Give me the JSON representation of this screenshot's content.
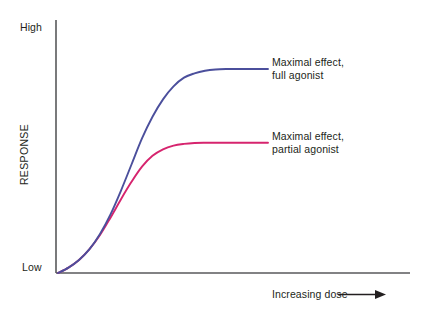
{
  "figure": {
    "background_color": "#ffffff",
    "axis_color": "#58595b"
  },
  "chart_data": {
    "type": "line",
    "title": "",
    "xlabel": "Increasing dose",
    "ylabel": "RESPONSE",
    "xlim": [
      0,
      10
    ],
    "ylim": [
      0,
      10
    ],
    "grid": false,
    "legend_position": "inline-right-of-curve",
    "x_tick_labels": [],
    "y_tick_labels": [
      "Low",
      "High"
    ],
    "annotations": [
      "Maximal effect, full agonist",
      "Maximal effect, partial agonist"
    ],
    "series": [
      {
        "name": "Maximal effect, full agonist",
        "color": "#4b4f9c",
        "maximal_effect": 9.4,
        "x": [
          0.0,
          0.5,
          1.0,
          1.5,
          2.0,
          2.5,
          3.0,
          3.5,
          4.0,
          4.5,
          5.0,
          5.5,
          6.0,
          6.5,
          7.0,
          7.5,
          8.0,
          8.5,
          9.0,
          9.5,
          10.0
        ],
        "y": [
          0.0,
          0.25,
          0.6,
          1.1,
          1.8,
          2.7,
          3.8,
          5.0,
          6.2,
          7.2,
          8.0,
          8.6,
          9.0,
          9.2,
          9.32,
          9.38,
          9.4,
          9.4,
          9.4,
          9.4,
          9.4
        ]
      },
      {
        "name": "Maximal effect, partial agonist",
        "color": "#d6246e",
        "maximal_effect": 6.0,
        "x": [
          0.0,
          0.5,
          1.0,
          1.5,
          2.0,
          2.5,
          3.0,
          3.5,
          4.0,
          4.5,
          5.0,
          5.5,
          6.0,
          6.5,
          7.0,
          7.5,
          8.0,
          8.5,
          9.0,
          9.5,
          10.0
        ],
        "y": [
          0.0,
          0.25,
          0.6,
          1.1,
          1.75,
          2.55,
          3.4,
          4.2,
          4.9,
          5.4,
          5.7,
          5.87,
          5.95,
          5.99,
          6.0,
          6.0,
          6.0,
          6.0,
          6.0,
          6.0,
          6.0
        ]
      }
    ]
  },
  "axes": {
    "y_high_label": "High",
    "y_low_label": "Low",
    "y_axis_title": "RESPONSE",
    "x_axis_title": "Increasing dose"
  },
  "legend": {
    "full_agonist_line1": "Maximal effect,",
    "full_agonist_line2": "full agonist",
    "partial_agonist_line1": "Maximal effect,",
    "partial_agonist_line2": "partial agonist"
  },
  "icons": {
    "arrow": "arrow-right-icon"
  }
}
